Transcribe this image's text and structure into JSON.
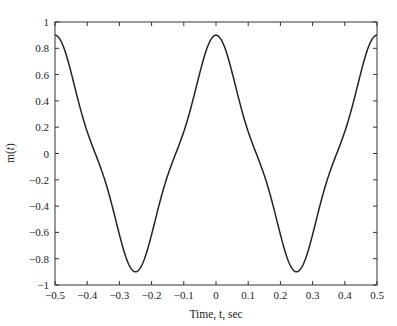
{
  "chart_data": {
    "type": "line",
    "title": "",
    "xlabel": "Time, t, sec",
    "ylabel": "m(t)",
    "ylabel_italic_part": "t",
    "xlim": [
      -0.5,
      0.5
    ],
    "ylim": [
      -1,
      1
    ],
    "xticks": [
      -0.5,
      -0.4,
      -0.3,
      -0.2,
      -0.1,
      0,
      0.1,
      0.2,
      0.3,
      0.4,
      0.5
    ],
    "xtick_labels": [
      "−0.5",
      "−0.4",
      "−0.3",
      "−0.2",
      "−0.1",
      "0",
      "0.1",
      "0.2",
      "0.3",
      "0.4",
      "0.5"
    ],
    "yticks": [
      1,
      0.8,
      0.6,
      0.4,
      0.2,
      0,
      -0.2,
      -0.4,
      -0.6,
      -0.8,
      -1
    ],
    "ytick_labels": [
      "1",
      "0.8",
      "0.6",
      "0.4",
      "0.2",
      "0",
      "−0.2",
      "−0.4",
      "−0.6",
      "−0.8",
      "−1"
    ],
    "grid": false,
    "legend": null,
    "line_color": "#222222",
    "series": [
      {
        "name": "m(t)",
        "x": [
          -0.5,
          -0.45,
          -0.4,
          -0.35,
          -0.3,
          -0.25,
          -0.2,
          -0.15,
          -0.1,
          -0.05,
          0,
          0.05,
          0.1,
          0.15,
          0.2,
          0.25,
          0.3,
          0.35,
          0.4,
          0.45,
          0.5
        ],
        "values": [
          0.9,
          0.59,
          0.22,
          -0.22,
          -0.59,
          -0.9,
          -0.59,
          -0.22,
          0.22,
          0.59,
          0.9,
          0.59,
          0.22,
          -0.22,
          -0.59,
          -0.9,
          -0.59,
          -0.22,
          0.22,
          0.59,
          0.9
        ]
      }
    ],
    "model": {
      "a1": 0.8,
      "f1": 2,
      "a3": 0.1,
      "f3": 6
    }
  }
}
